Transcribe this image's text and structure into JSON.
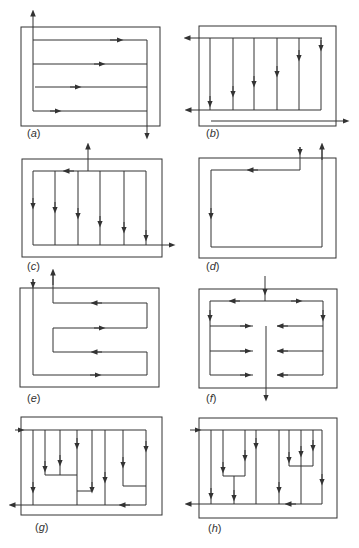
{
  "figure": {
    "stroke_color": "#333333",
    "panels": [
      {
        "id": "a",
        "label_open": "(",
        "label_letter": "a",
        "label_close": ")",
        "pattern": "serpentine-horizontal-parallel"
      },
      {
        "id": "b",
        "label_open": "(",
        "label_letter": "b",
        "label_close": ")",
        "pattern": "vertical-parallel-from-top-header"
      },
      {
        "id": "c",
        "label_open": "(",
        "label_letter": "c",
        "label_close": ")",
        "pattern": "top-center-entry-vertical-parallel"
      },
      {
        "id": "d",
        "label_open": "(",
        "label_letter": "d",
        "label_close": ")",
        "pattern": "single-loop"
      },
      {
        "id": "e",
        "label_open": "(",
        "label_letter": "e",
        "label_close": ")",
        "pattern": "serpentine-E-shape"
      },
      {
        "id": "f",
        "label_open": "(",
        "label_letter": "f",
        "label_close": ")",
        "pattern": "split-center-collector"
      },
      {
        "id": "g",
        "label_open": "(",
        "label_letter": "g",
        "label_close": ")",
        "pattern": "branched-tree-1"
      },
      {
        "id": "h",
        "label_open": "(",
        "label_letter": "h",
        "label_close": ")",
        "pattern": "branched-tree-2"
      }
    ]
  }
}
